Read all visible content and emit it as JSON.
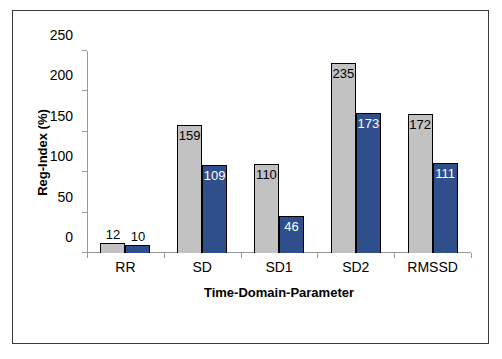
{
  "chart_data": {
    "type": "bar",
    "title": "",
    "subtitle": "",
    "xlabel": "Time-Domain-Parameter",
    "ylabel": "Reg-Index (%)",
    "categories": [
      "RR",
      "SD",
      "SD1",
      "SD2",
      "RMSSD"
    ],
    "ylim": [
      0,
      250
    ],
    "yticks": [
      0,
      50,
      100,
      150,
      200,
      250
    ],
    "ytick_labels": [
      "0",
      "50",
      "100",
      "150",
      "200",
      "250"
    ],
    "grid": false,
    "legend": "none",
    "series": [
      {
        "name": "gray",
        "color": "#c2c2c2",
        "values": [
          12,
          159,
          110,
          235,
          172
        ],
        "labels": [
          "12",
          "159",
          "110",
          "235",
          "172"
        ]
      },
      {
        "name": "blue",
        "color": "#2f4f8c",
        "values": [
          10,
          109,
          46,
          173,
          111
        ],
        "labels": [
          "10",
          "109",
          "46",
          "173",
          "111"
        ]
      }
    ]
  },
  "figure": {
    "border_color": "#3a3a3a",
    "axis_color": "#9a9a9a",
    "bar_border_color": "#000000"
  }
}
